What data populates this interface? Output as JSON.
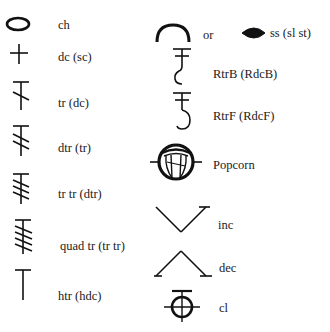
{
  "left_column": [
    {
      "symbol": "oval-chain",
      "label": "ch"
    },
    {
      "symbol": "plus-cross",
      "label": "dc (sc)"
    },
    {
      "symbol": "t-one-slash",
      "label": "tr (dc)"
    },
    {
      "symbol": "t-two-slashes",
      "label": "dtr (tr)"
    },
    {
      "symbol": "t-three-slashes",
      "label": "tr tr (dtr)"
    },
    {
      "symbol": "t-four-slashes",
      "label": "quad tr (tr tr)"
    },
    {
      "symbol": "plain-t",
      "label": "htr (hdc)"
    }
  ],
  "right_column": [
    {
      "symbol": "arc-or-filled-oval",
      "label": "ss (sl st)",
      "connector": "or"
    },
    {
      "symbol": "raised-back-hook",
      "label": "RtrB (RdcB)"
    },
    {
      "symbol": "raised-front-hook",
      "label": "RtrF (RdcF)"
    },
    {
      "symbol": "popcorn-circle",
      "label": "Popcorn"
    },
    {
      "symbol": "v-increase",
      "label": "inc"
    },
    {
      "symbol": "caret-decrease",
      "label": "dec"
    },
    {
      "symbol": "circle-cluster",
      "label": "cl"
    }
  ],
  "colors": {
    "ink": "#111111",
    "background": "#ffffff"
  }
}
